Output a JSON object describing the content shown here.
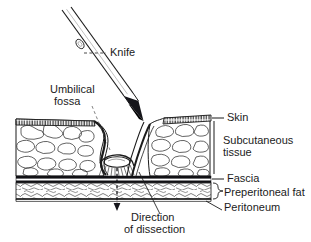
{
  "figure": {
    "kind": "anatomical-cross-section",
    "background_color": "#ffffff",
    "ink_color": "#1b1b1b",
    "width": 311,
    "height": 242
  },
  "labels": {
    "knife": "Knife",
    "umbilical_fossa_line1": "Umbilical",
    "umbilical_fossa_line2": "fossa",
    "skin": "Skin",
    "subcutaneous_line1": "Subcutaneous",
    "subcutaneous_line2": "tissue",
    "fascia": "Fascia",
    "preperitoneal_fat": "Preperitoneal fat",
    "peritoneum": "Peritoneum",
    "direction_line1": "Direction",
    "direction_line2": "of dissection"
  },
  "layers": [
    {
      "name": "skin",
      "label": "Skin",
      "order": 1,
      "rendering": "hatched band"
    },
    {
      "name": "subcutaneous-tissue",
      "label": "Subcutaneous tissue",
      "order": 2,
      "rendering": "fat lobules"
    },
    {
      "name": "fascia",
      "label": "Fascia",
      "order": 3,
      "rendering": "thick dark band"
    },
    {
      "name": "preperitoneal-fat",
      "label": "Preperitoneal fat",
      "order": 4,
      "rendering": "fine cells"
    },
    {
      "name": "peritoneum",
      "label": "Peritoneum",
      "order": 5,
      "rendering": "thin line"
    }
  ],
  "instrument": {
    "name": "scalpel",
    "label": "Knife"
  },
  "annotations": {
    "dissection_arrow": {
      "label": "Direction of dissection",
      "direction": "downward"
    }
  }
}
